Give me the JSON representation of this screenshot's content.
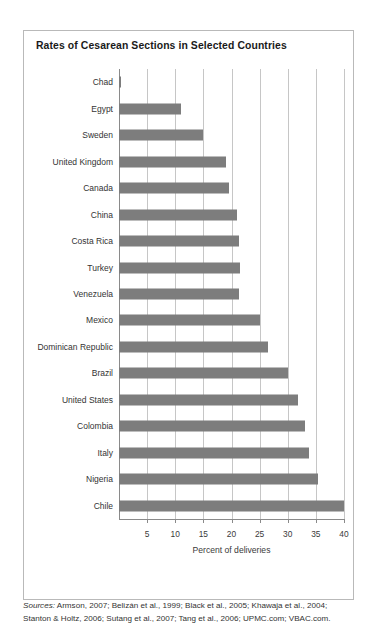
{
  "chart_title": "Rates of Cesarean Sections in Selected Countries",
  "axis": {
    "x_label": "Percent of deliveries",
    "x_ticks": [
      5,
      10,
      15,
      20,
      25,
      30,
      35,
      40
    ],
    "x_min": 0,
    "x_max": 40
  },
  "sources": {
    "prefix": "Sources:",
    "line1": " Armson, 2007; Belizán et al., 1999; Black et al., 2005; Khawaja et al., 2004;",
    "line2": "Stanton & Holtz, 2006; Sutang et al., 2007; Tang et al., 2006; UPMC.com; VBAC.com."
  },
  "colors": {
    "bar": "#7d7d7d",
    "grid": "#c6c6c6",
    "axis": "#8a8a8a",
    "panel_border": "#b9b9b9",
    "text": "#333333",
    "background": "#ffffff"
  },
  "chart_data": {
    "type": "bar",
    "orientation": "horizontal",
    "title": "Rates of Cesarean Sections in Selected Countries",
    "xlabel": "Percent of deliveries",
    "ylabel": "",
    "xlim": [
      0,
      40
    ],
    "grid": true,
    "legend": false,
    "categories": [
      "Chad",
      "Egypt",
      "Sweden",
      "United Kingdom",
      "Canada",
      "China",
      "Costa Rica",
      "Turkey",
      "Venezuela",
      "Mexico",
      "Dominican Republic",
      "Brazil",
      "United States",
      "Colombia",
      "Italy",
      "Nigeria",
      "Chile"
    ],
    "values": [
      0.4,
      11,
      15,
      19,
      19.5,
      21,
      21.3,
      21.5,
      21.4,
      25,
      26.5,
      30,
      31.8,
      33,
      33.7,
      35.3,
      40
    ],
    "tick_labels": [
      "5",
      "10",
      "15",
      "20",
      "25",
      "30",
      "35",
      "40"
    ]
  }
}
